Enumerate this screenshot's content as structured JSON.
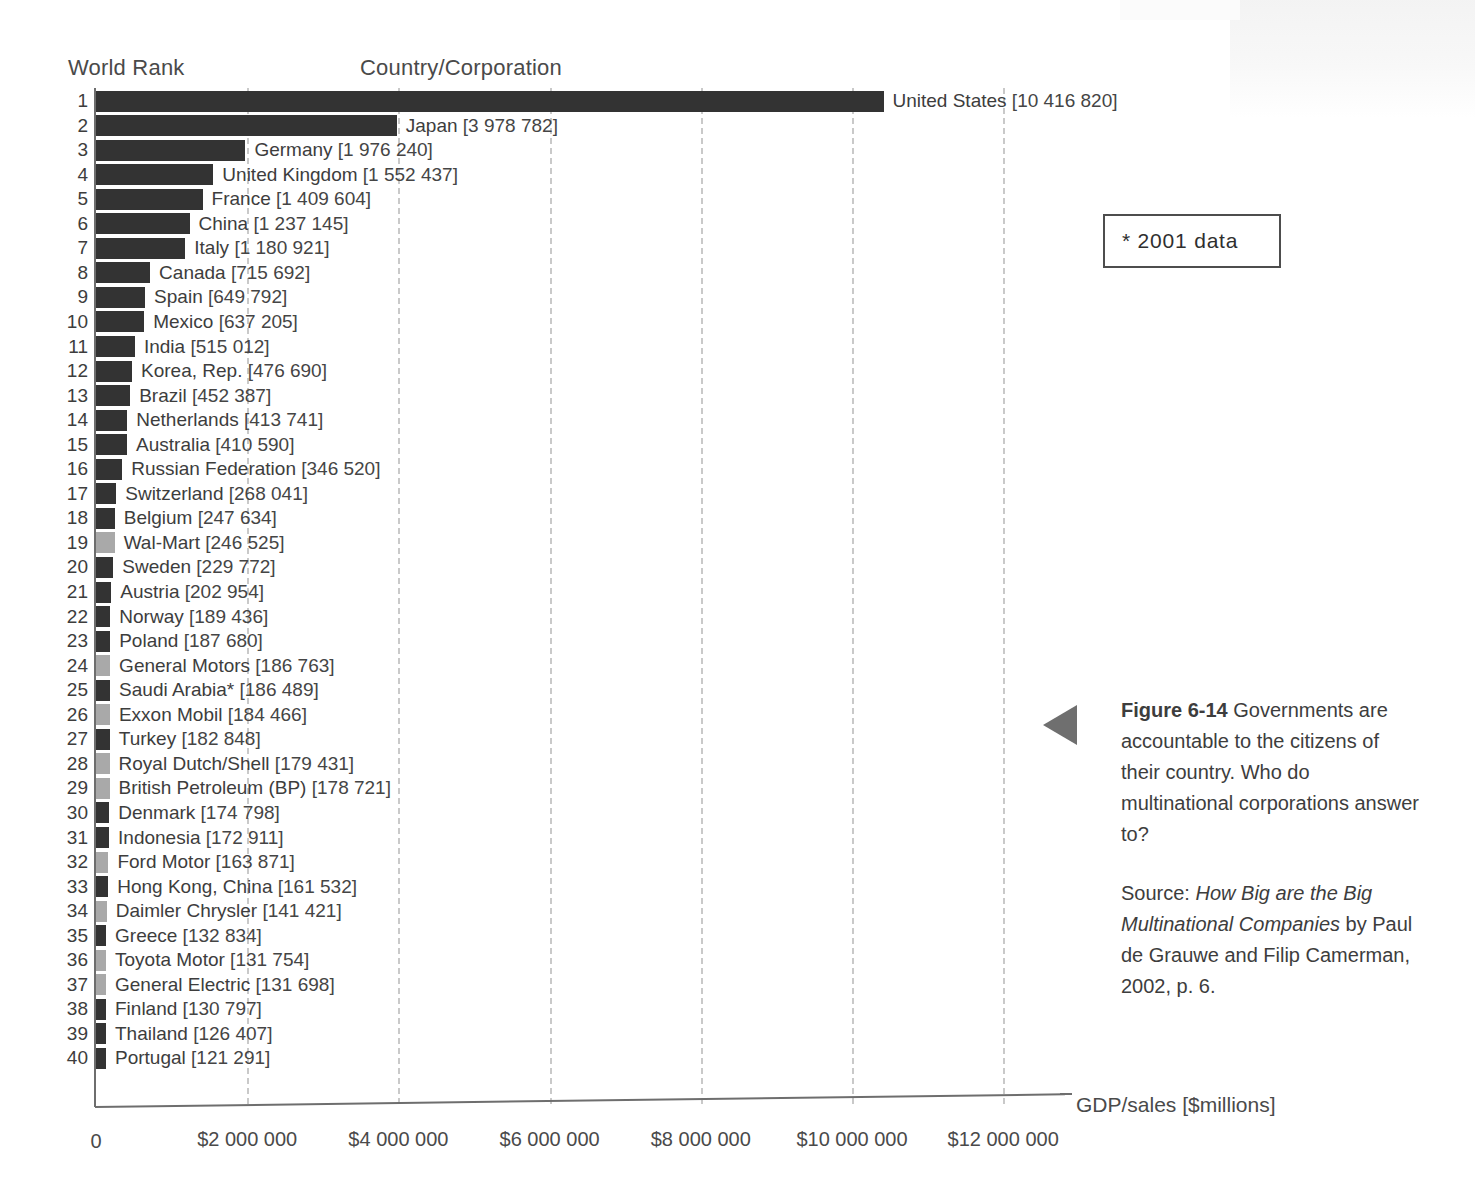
{
  "headers": {
    "rank": "World Rank",
    "country": "Country/Corporation"
  },
  "note": {
    "text": "* 2001 data"
  },
  "axis": {
    "title": "GDP/sales [$millions]",
    "ticks": [
      "0",
      "$2 000 000",
      "$4 000 000",
      "$6 000 000",
      "$8 000 000",
      "$10 000 000",
      "$12 000 000"
    ],
    "tick_values": [
      0,
      2000000,
      4000000,
      6000000,
      8000000,
      10000000,
      12000000
    ]
  },
  "caption": {
    "figure_label": "Figure 6-14",
    "body": " Governments are accountable to the citizens of their country. Who do multinational corporations answer to?",
    "source_prefix": "Source: ",
    "source_title": "How Big are the Big Multinational Companies",
    "source_rest": " by Paul de Grauwe and Filip Camerman, 2002, p. 6."
  },
  "colors": {
    "country_bar": "#333333",
    "corporation_bar": "#a9a9a9",
    "gridline": "#c9c9c9",
    "axis": "#6e6e6e",
    "text": "#3d3d3d",
    "arrow": "#6f6f6f"
  },
  "chart_data": {
    "type": "bar",
    "orientation": "horizontal",
    "title": "",
    "xlabel": "GDP/sales [$millions]",
    "ylabel": "World Rank",
    "xlim": [
      0,
      12400000
    ],
    "grid": true,
    "legend": [
      {
        "label": "Country",
        "color": "#333333"
      },
      {
        "label": "Corporation",
        "color": "#a9a9a9"
      }
    ],
    "categories": [
      "United States",
      "Japan",
      "Germany",
      "United Kingdom",
      "France",
      "China",
      "Italy",
      "Canada",
      "Spain",
      "Mexico",
      "India",
      "Korea, Rep.",
      "Brazil",
      "Netherlands",
      "Australia",
      "Russian Federation",
      "Switzerland",
      "Belgium",
      "Wal-Mart",
      "Sweden",
      "Austria",
      "Norway",
      "Poland",
      "General Motors",
      "Saudi Arabia*",
      "Exxon Mobil",
      "Turkey",
      "Royal Dutch/Shell",
      "British Petroleum (BP)",
      "Denmark",
      "Indonesia",
      "Ford Motor",
      "Hong Kong, China",
      "Daimler Chrysler",
      "Greece",
      "Toyota Motor",
      "General Electric",
      "Finland",
      "Thailand",
      "Portugal"
    ],
    "values": [
      10416820,
      3978782,
      1976240,
      1552437,
      1409604,
      1237145,
      1180921,
      715692,
      649792,
      637205,
      515012,
      476690,
      452387,
      413741,
      410590,
      346520,
      268041,
      247634,
      246525,
      229772,
      202954,
      189436,
      187680,
      186763,
      186489,
      184466,
      182848,
      179431,
      178721,
      174798,
      172911,
      163871,
      161532,
      141421,
      132834,
      131754,
      131698,
      130797,
      126407,
      121291
    ],
    "rows": [
      {
        "rank": "1",
        "name": "United States",
        "value": 10416820,
        "value_text": "[10 416 820]",
        "type": "country"
      },
      {
        "rank": "2",
        "name": "Japan",
        "value": 3978782,
        "value_text": "[3 978 782]",
        "type": "country"
      },
      {
        "rank": "3",
        "name": "Germany",
        "value": 1976240,
        "value_text": "[1 976 240]",
        "type": "country"
      },
      {
        "rank": "4",
        "name": "United Kingdom",
        "value": 1552437,
        "value_text": "[1 552 437]",
        "type": "country"
      },
      {
        "rank": "5",
        "name": "France",
        "value": 1409604,
        "value_text": "[1 409 604]",
        "type": "country"
      },
      {
        "rank": "6",
        "name": "China",
        "value": 1237145,
        "value_text": "[1 237 145]",
        "type": "country"
      },
      {
        "rank": "7",
        "name": "Italy",
        "value": 1180921,
        "value_text": "[1 180 921]",
        "type": "country"
      },
      {
        "rank": "8",
        "name": "Canada",
        "value": 715692,
        "value_text": "[715 692]",
        "type": "country"
      },
      {
        "rank": "9",
        "name": "Spain",
        "value": 649792,
        "value_text": "[649 792]",
        "type": "country"
      },
      {
        "rank": "10",
        "name": "Mexico",
        "value": 637205,
        "value_text": "[637 205]",
        "type": "country"
      },
      {
        "rank": "11",
        "name": "India",
        "value": 515012,
        "value_text": "[515 012]",
        "type": "country"
      },
      {
        "rank": "12",
        "name": "Korea, Rep.",
        "value": 476690,
        "value_text": "[476 690]",
        "type": "country"
      },
      {
        "rank": "13",
        "name": "Brazil",
        "value": 452387,
        "value_text": "[452 387]",
        "type": "country"
      },
      {
        "rank": "14",
        "name": "Netherlands",
        "value": 413741,
        "value_text": "[413 741]",
        "type": "country"
      },
      {
        "rank": "15",
        "name": "Australia",
        "value": 410590,
        "value_text": "[410 590]",
        "type": "country"
      },
      {
        "rank": "16",
        "name": "Russian Federation",
        "value": 346520,
        "value_text": "[346 520]",
        "type": "country"
      },
      {
        "rank": "17",
        "name": "Switzerland",
        "value": 268041,
        "value_text": "[268 041]",
        "type": "country"
      },
      {
        "rank": "18",
        "name": "Belgium",
        "value": 247634,
        "value_text": "[247 634]",
        "type": "country"
      },
      {
        "rank": "19",
        "name": "Wal-Mart",
        "value": 246525,
        "value_text": "[246 525]",
        "type": "corporation"
      },
      {
        "rank": "20",
        "name": "Sweden",
        "value": 229772,
        "value_text": "[229 772]",
        "type": "country"
      },
      {
        "rank": "21",
        "name": "Austria",
        "value": 202954,
        "value_text": "[202 954]",
        "type": "country"
      },
      {
        "rank": "22",
        "name": "Norway",
        "value": 189436,
        "value_text": "[189 436]",
        "type": "country"
      },
      {
        "rank": "23",
        "name": "Poland",
        "value": 187680,
        "value_text": "[187 680]",
        "type": "country"
      },
      {
        "rank": "24",
        "name": "General Motors",
        "value": 186763,
        "value_text": "[186 763]",
        "type": "corporation"
      },
      {
        "rank": "25",
        "name": "Saudi Arabia*",
        "value": 186489,
        "value_text": "[186 489]",
        "type": "country"
      },
      {
        "rank": "26",
        "name": "Exxon Mobil",
        "value": 184466,
        "value_text": "[184 466]",
        "type": "corporation"
      },
      {
        "rank": "27",
        "name": "Turkey",
        "value": 182848,
        "value_text": "[182 848]",
        "type": "country"
      },
      {
        "rank": "28",
        "name": "Royal Dutch/Shell",
        "value": 179431,
        "value_text": "[179 431]",
        "type": "corporation"
      },
      {
        "rank": "29",
        "name": "British Petroleum (BP)",
        "value": 178721,
        "value_text": "[178 721]",
        "type": "corporation"
      },
      {
        "rank": "30",
        "name": "Denmark",
        "value": 174798,
        "value_text": "[174 798]",
        "type": "country"
      },
      {
        "rank": "31",
        "name": "Indonesia",
        "value": 172911,
        "value_text": "[172 911]",
        "type": "country"
      },
      {
        "rank": "32",
        "name": "Ford Motor",
        "value": 163871,
        "value_text": "[163 871]",
        "type": "corporation"
      },
      {
        "rank": "33",
        "name": "Hong Kong, China",
        "value": 161532,
        "value_text": "[161 532]",
        "type": "country"
      },
      {
        "rank": "34",
        "name": "Daimler Chrysler",
        "value": 141421,
        "value_text": "[141 421]",
        "type": "corporation"
      },
      {
        "rank": "35",
        "name": "Greece",
        "value": 132834,
        "value_text": "[132 834]",
        "type": "country"
      },
      {
        "rank": "36",
        "name": "Toyota Motor",
        "value": 131754,
        "value_text": "[131 754]",
        "type": "corporation"
      },
      {
        "rank": "37",
        "name": "General Electric",
        "value": 131698,
        "value_text": "[131 698]",
        "type": "corporation"
      },
      {
        "rank": "38",
        "name": "Finland",
        "value": 130797,
        "value_text": "[130 797]",
        "type": "country"
      },
      {
        "rank": "39",
        "name": "Thailand",
        "value": 126407,
        "value_text": "[126 407]",
        "type": "country"
      },
      {
        "rank": "40",
        "name": "Portugal",
        "value": 121291,
        "value_text": "[121 291]",
        "type": "country"
      }
    ]
  }
}
